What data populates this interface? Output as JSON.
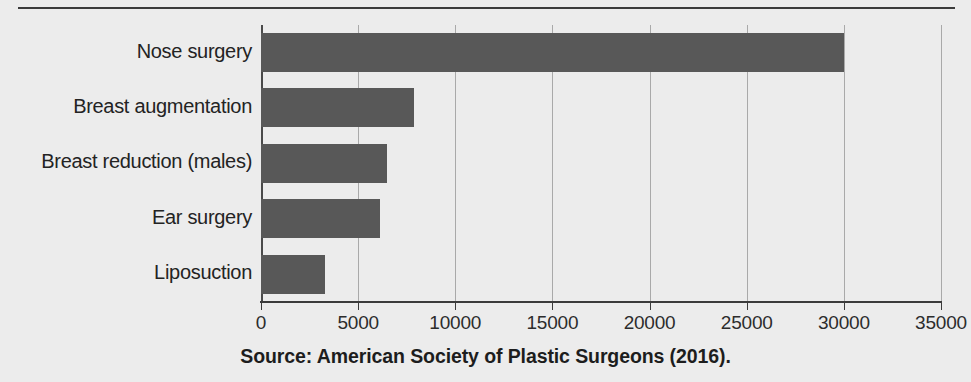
{
  "figure": {
    "top_rule": "horizontal-rule",
    "source_caption": "Source: American Society of Plastic Surgeons (2016).",
    "bar_color": "#585858",
    "gridline_color": "#a9a9a9",
    "axis_color": "#3b3b3b",
    "background_color": "#ececec"
  },
  "chart_data": {
    "type": "bar",
    "orientation": "horizontal",
    "title": "",
    "subtitle": "",
    "xlabel": "",
    "ylabel": "",
    "categories": [
      "Nose surgery",
      "Breast augmentation",
      "Breast reduction (males)",
      "Ear surgery",
      "Liposuction"
    ],
    "values": [
      30000,
      7900,
      6500,
      6100,
      3300
    ],
    "xlim": [
      0,
      35000
    ],
    "xticks": [
      0,
      5000,
      10000,
      15000,
      20000,
      25000,
      30000,
      35000
    ],
    "xtick_labels": [
      "0",
      "5000",
      "10000",
      "15000",
      "20000",
      "25000",
      "30000",
      "35000"
    ],
    "grid": true,
    "grid_axis": "x",
    "legend": null,
    "annotations": [],
    "source": "Source: American Society of Plastic Surgeons (2016)."
  }
}
